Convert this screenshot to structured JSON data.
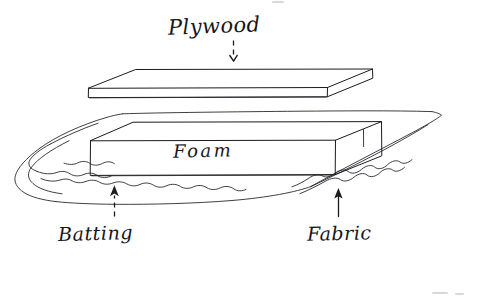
{
  "page": {
    "background_color": "#ffffff",
    "ink_color": "#1c1b20",
    "width": 479,
    "height": 303,
    "medium": "hand-drawn pen sketch"
  },
  "labels": {
    "plywood": "Plywood",
    "foam": "Foam",
    "batting": "Batting",
    "fabric": "Fabric"
  },
  "annotations": {
    "plywood_arrow": "dashed-arrow-down",
    "batting_arrow": "dashed-arrow-up",
    "fabric_arrow": "solid-arrow-up"
  },
  "parts": {
    "plywood_board": "plywood-board-slab",
    "foam_block": "foam-block-slab",
    "batting_layer": "batting-wavy-layer",
    "fabric_layer": "fabric-outer-layer"
  }
}
